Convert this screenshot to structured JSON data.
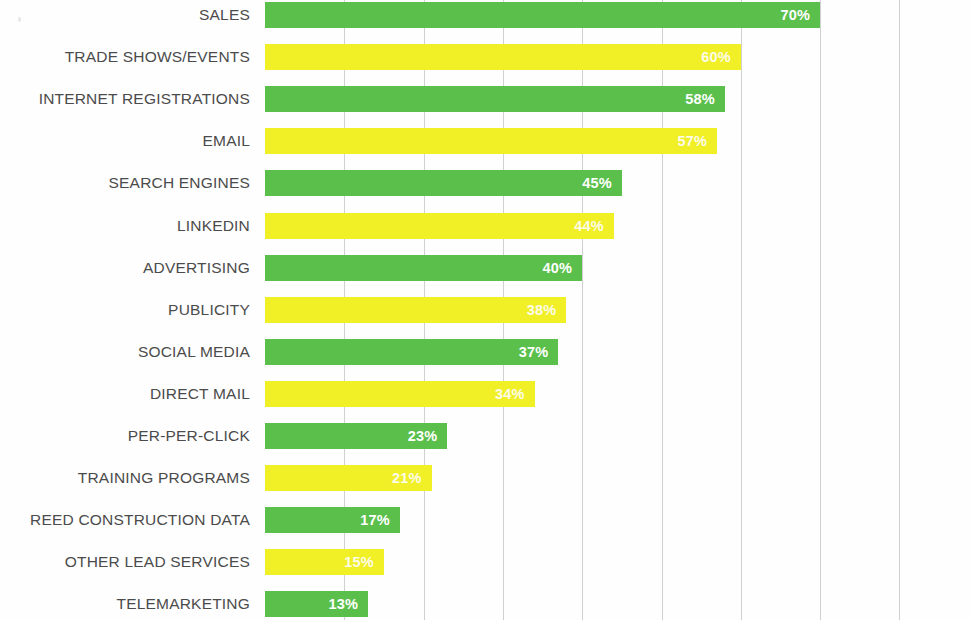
{
  "chart_data": {
    "type": "bar",
    "orientation": "horizontal",
    "title": "",
    "subtitle": "",
    "xlabel": "",
    "ylabel": "",
    "xlim": [
      0,
      89
    ],
    "grid": true,
    "grid_axis": "x",
    "legend": "none",
    "value_suffix": "%",
    "colors": {
      "green": "#5bc04b",
      "yellow": "#f1ef26",
      "gridline": "#cfd0d1",
      "label_text": "#4b4b4b",
      "value_text": "#ffffff",
      "background": "#fefefe"
    },
    "gridline_values": [
      10,
      20,
      30,
      40,
      50,
      60,
      70,
      80
    ],
    "categories": [
      "SALES",
      "TRADE SHOWS/EVENTS",
      "INTERNET REGISTRATIONS",
      "EMAIL",
      "SEARCH ENGINES",
      "LINKEDIN",
      "ADVERTISING",
      "PUBLICITY",
      "SOCIAL MEDIA",
      "DIRECT MAIL",
      "PER-PER-CLICK",
      "TRAINING PROGRAMS",
      "REED CONSTRUCTION DATA",
      "OTHER LEAD SERVICES",
      "TELEMARKETING"
    ],
    "values": [
      70,
      60,
      58,
      57,
      45,
      44,
      40,
      38,
      37,
      34,
      23,
      21,
      17,
      15,
      13
    ],
    "value_labels": [
      "70%",
      "60%",
      "58%",
      "57%",
      "45%",
      "44%",
      "40%",
      "38%",
      "37%",
      "34%",
      "23%",
      "21%",
      "17%",
      "15%",
      "13%"
    ],
    "bar_colors": [
      "green",
      "yellow",
      "green",
      "yellow",
      "green",
      "yellow",
      "green",
      "yellow",
      "green",
      "yellow",
      "green",
      "yellow",
      "green",
      "yellow",
      "green"
    ],
    "bars": [
      {
        "label": "SALES",
        "value": 70,
        "value_label": "70%",
        "color": "green"
      },
      {
        "label": "TRADE SHOWS/EVENTS",
        "value": 60,
        "value_label": "60%",
        "color": "yellow"
      },
      {
        "label": "INTERNET REGISTRATIONS",
        "value": 58,
        "value_label": "58%",
        "color": "green"
      },
      {
        "label": "EMAIL",
        "value": 57,
        "value_label": "57%",
        "color": "yellow"
      },
      {
        "label": "SEARCH ENGINES",
        "value": 45,
        "value_label": "45%",
        "color": "green"
      },
      {
        "label": "LINKEDIN",
        "value": 44,
        "value_label": "44%",
        "color": "yellow"
      },
      {
        "label": "ADVERTISING",
        "value": 40,
        "value_label": "40%",
        "color": "green"
      },
      {
        "label": "PUBLICITY",
        "value": 38,
        "value_label": "38%",
        "color": "yellow"
      },
      {
        "label": "SOCIAL MEDIA",
        "value": 37,
        "value_label": "37%",
        "color": "green"
      },
      {
        "label": "DIRECT MAIL",
        "value": 34,
        "value_label": "34%",
        "color": "yellow"
      },
      {
        "label": "PER-PER-CLICK",
        "value": 23,
        "value_label": "23%",
        "color": "green"
      },
      {
        "label": "TRAINING PROGRAMS",
        "value": 21,
        "value_label": "21%",
        "color": "yellow"
      },
      {
        "label": "REED CONSTRUCTION DATA",
        "value": 17,
        "value_label": "17%",
        "color": "green"
      },
      {
        "label": "OTHER LEAD SERVICES",
        "value": 15,
        "value_label": "15%",
        "color": "yellow"
      },
      {
        "label": "TELEMARKETING",
        "value": 13,
        "value_label": "13%",
        "color": "green"
      }
    ]
  }
}
